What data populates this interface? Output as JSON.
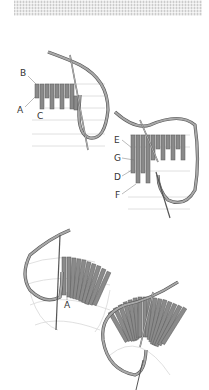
{
  "header": {
    "texture": "canvas-texture-strip"
  },
  "figures": [
    {
      "id": "fig1",
      "labels": [
        "B",
        "A",
        "C"
      ]
    },
    {
      "id": "fig2",
      "labels": [
        "E",
        "G",
        "D",
        "F"
      ]
    },
    {
      "id": "fig3",
      "labels": [
        "A"
      ]
    },
    {
      "id": "fig4",
      "labels": []
    }
  ],
  "colors": {
    "stitch": "#8a8a8a",
    "stitch_dark": "#6b6b6b",
    "thread": "#9a9a9a",
    "guide": "#d0d0d0",
    "label": "#333333"
  }
}
